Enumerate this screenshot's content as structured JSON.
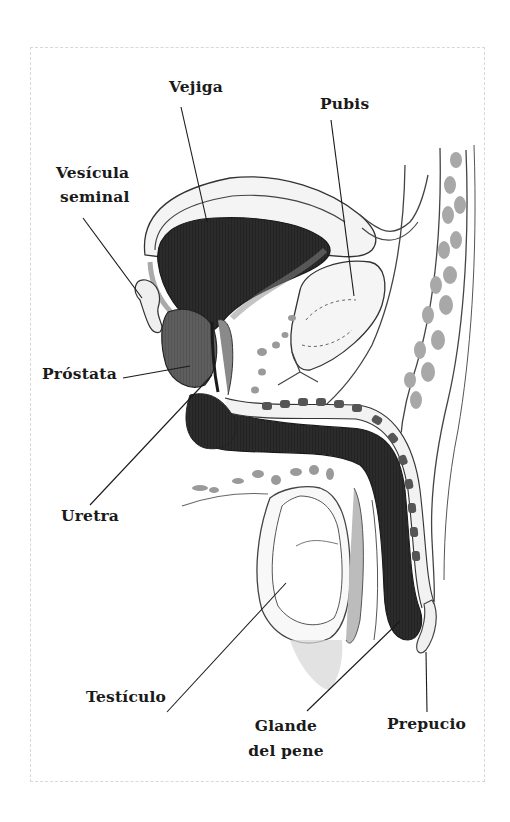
{
  "diagram": {
    "type": "anatomical-illustration",
    "labels": {
      "vejiga": "Vejiga",
      "pubis": "Pubis",
      "vesicula_line1": "Vesícula",
      "vesicula_line2": "seminal",
      "prostata": "Próstata",
      "uretra": "Uretra",
      "testiculo": "Testículo",
      "glande_line1": "Glande",
      "glande_line2": "del pene",
      "prepucio": "Prepucio"
    },
    "colors": {
      "background": "#ffffff",
      "ink": "#1a1a1a",
      "dark_fill": "#2a2a2a",
      "mid_fill": "#5a5a5a",
      "light_fill": "#9a9a9a",
      "pale_fill": "#e8e8e8",
      "frame": "#d8d8d8"
    }
  }
}
